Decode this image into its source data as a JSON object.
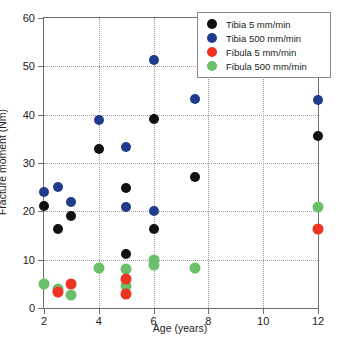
{
  "chart_data": {
    "type": "scatter",
    "title": "",
    "xlabel": "Age (years)",
    "ylabel": "Fracture moment (Nm)",
    "xlim": [
      2,
      12
    ],
    "ylim": [
      0,
      60
    ],
    "xticks": [
      2,
      4,
      6,
      8,
      10,
      12
    ],
    "yticks": [
      0,
      10,
      20,
      30,
      40,
      50,
      60
    ],
    "grid": true,
    "legend_position": "top-right",
    "series": [
      {
        "name": "Tibia 5 mm/min",
        "color": "#111111",
        "points": [
          {
            "x": 2.0,
            "y": 21.2
          },
          {
            "x": 2.5,
            "y": 16.3
          },
          {
            "x": 3.0,
            "y": 19.0
          },
          {
            "x": 4.0,
            "y": 33.0
          },
          {
            "x": 5.0,
            "y": 24.8
          },
          {
            "x": 5.0,
            "y": 11.2
          },
          {
            "x": 6.0,
            "y": 39.1
          },
          {
            "x": 6.0,
            "y": 16.3
          },
          {
            "x": 7.5,
            "y": 27.2
          },
          {
            "x": 12.0,
            "y": 35.5
          }
        ]
      },
      {
        "name": "Tibia 500 mm/min",
        "color": "#1f3b8c",
        "points": [
          {
            "x": 2.0,
            "y": 24.0
          },
          {
            "x": 2.5,
            "y": 25.0
          },
          {
            "x": 3.0,
            "y": 22.0
          },
          {
            "x": 4.0,
            "y": 38.9
          },
          {
            "x": 5.0,
            "y": 33.3
          },
          {
            "x": 5.0,
            "y": 20.8
          },
          {
            "x": 6.0,
            "y": 51.3
          },
          {
            "x": 6.0,
            "y": 20.0
          },
          {
            "x": 7.5,
            "y": 43.3
          },
          {
            "x": 12.0,
            "y": 43.0
          }
        ]
      },
      {
        "name": "Fibula 5 mm/min",
        "color": "#ee3322",
        "points": [
          {
            "x": 2.5,
            "y": 3.3
          },
          {
            "x": 3.0,
            "y": 5.0
          },
          {
            "x": 5.0,
            "y": 6.0
          },
          {
            "x": 5.0,
            "y": 2.9
          },
          {
            "x": 12.0,
            "y": 16.3
          }
        ]
      },
      {
        "name": "Fibula 500 mm/min",
        "color": "#6abf6a",
        "points": [
          {
            "x": 2.0,
            "y": 5.0
          },
          {
            "x": 2.5,
            "y": 4.0
          },
          {
            "x": 3.0,
            "y": 2.7
          },
          {
            "x": 4.0,
            "y": 8.2
          },
          {
            "x": 5.0,
            "y": 8.0
          },
          {
            "x": 5.0,
            "y": 4.5
          },
          {
            "x": 6.0,
            "y": 10.0
          },
          {
            "x": 6.0,
            "y": 8.8
          },
          {
            "x": 7.5,
            "y": 8.2
          },
          {
            "x": 12.0,
            "y": 20.9
          }
        ]
      }
    ]
  },
  "legend": {
    "items": [
      {
        "label": "Tibia 5 mm/min",
        "color": "#111111"
      },
      {
        "label": "Tibia 500 mm/min",
        "color": "#1f3b8c"
      },
      {
        "label": "Fibula 5 mm/min",
        "color": "#ee3322"
      },
      {
        "label": "Fibula 500 mm/min",
        "color": "#6abf6a"
      }
    ]
  },
  "axes": {
    "x_title": "Age (years)",
    "y_title": "Fracture moment (Nm)",
    "x_tick_labels": [
      "2",
      "4",
      "6",
      "8",
      "10",
      "12"
    ],
    "y_tick_labels": [
      "0",
      "10",
      "20",
      "30",
      "40",
      "50",
      "60"
    ]
  }
}
